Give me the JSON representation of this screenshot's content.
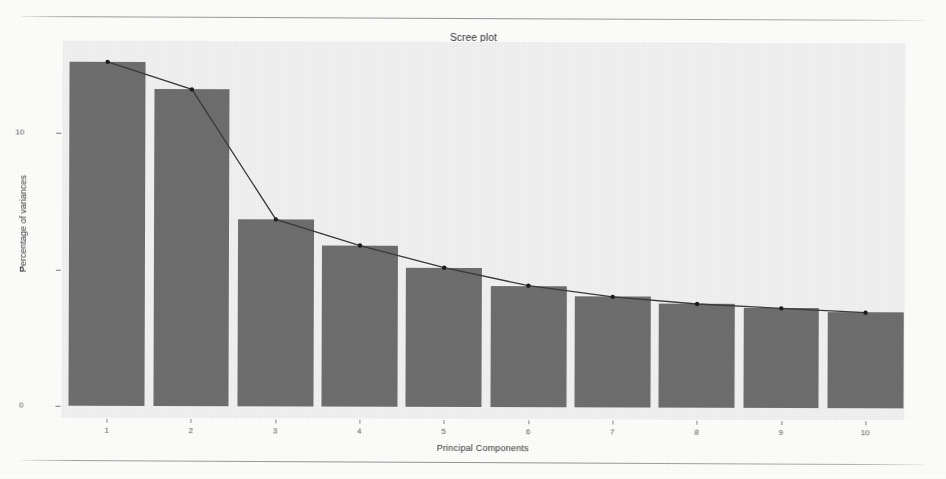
{
  "page": {
    "background_color": "#fdfdfc",
    "rule_color": "#6e6e6e",
    "ghost_text": "the one has been unattainable due to the practical and theoretical problems. It also shows that the overall components extracted for analysis are only the first components which have been adopted for the research. The remaining variance proportion explained by these components is considerably smaller and therefore discarded."
  },
  "chart_data": {
    "type": "bar",
    "title": "Scree plot",
    "xlabel": "Principal Components",
    "ylabel": "Percentage of variances",
    "categories": [
      "1",
      "2",
      "3",
      "4",
      "5",
      "6",
      "7",
      "8",
      "9",
      "10"
    ],
    "values": [
      12.6,
      11.6,
      6.85,
      5.9,
      5.1,
      4.45,
      4.05,
      3.8,
      3.65,
      3.5
    ],
    "series": [
      {
        "name": "Percentage of variances",
        "type": "bar",
        "values": [
          12.6,
          11.6,
          6.85,
          5.9,
          5.1,
          4.45,
          4.05,
          3.8,
          3.65,
          3.5
        ]
      },
      {
        "name": "Scree line",
        "type": "line",
        "values": [
          12.6,
          11.6,
          6.85,
          5.9,
          5.1,
          4.45,
          4.05,
          3.8,
          3.65,
          3.5
        ]
      }
    ],
    "ylim": [
      0,
      13.4
    ],
    "yticks": [
      0,
      5,
      10
    ],
    "ytick_labels": [
      "0",
      "5",
      "10"
    ],
    "xticks": [
      "1",
      "2",
      "3",
      "4",
      "5",
      "6",
      "7",
      "8",
      "9",
      "10"
    ],
    "grid": false,
    "legend": null,
    "bar_color": "#6e6e6e",
    "line_color": "#3a3a3a",
    "point_color": "#1d1d1d",
    "panel_color": "#f1f1f1"
  }
}
